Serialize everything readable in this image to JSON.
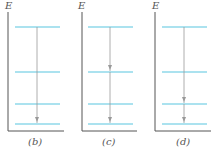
{
  "axis_label": "E",
  "colors": {
    "level": "#8fd8ea",
    "axis": "#555555",
    "arrow": "#999999"
  },
  "panels": [
    {
      "label": "(b)",
      "axis_x": 8,
      "x1": 15,
      "x2": 60,
      "arrow_x": 37,
      "arrows": [
        [
          27,
          124
        ]
      ]
    },
    {
      "label": "(c)",
      "axis_x": 82,
      "x1": 88,
      "x2": 133,
      "arrow_x": 110,
      "arrows": [
        [
          27,
          72
        ],
        [
          72,
          124
        ]
      ]
    },
    {
      "label": "(d)",
      "axis_x": 155,
      "x1": 162,
      "x2": 207,
      "arrow_x": 184,
      "arrows": [
        [
          27,
          104
        ],
        [
          104,
          124
        ]
      ]
    }
  ],
  "levels_y": [
    27,
    72,
    104,
    124
  ]
}
